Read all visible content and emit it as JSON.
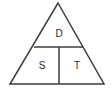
{
  "diagram": {
    "type": "formula-triangle",
    "background_color": "#ffffff",
    "stroke_color": "#3b3b3b",
    "text_color": "#2b2b2b",
    "cells": {
      "top": "D",
      "bottom_left": "S",
      "bottom_right": "T"
    },
    "geometry": {
      "apex": [
        58,
        3
      ],
      "bottom_left": [
        10,
        84
      ],
      "bottom_right": [
        104,
        84
      ],
      "horizontal_divider": [
        34,
        47,
        83,
        47
      ],
      "vertical_divider": [
        59,
        47,
        59,
        84
      ]
    }
  }
}
